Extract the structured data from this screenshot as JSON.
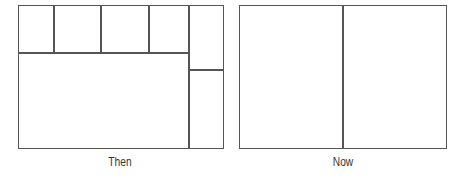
{
  "diagram": {
    "line_color": "#555555",
    "panels": [
      {
        "id": "then",
        "caption": "Then",
        "description": "Fragmented layout: four small boxes across the top, one large box below, and a right column split into two boxes",
        "regions": [
          "top-box-1",
          "top-box-2",
          "top-box-3",
          "top-box-4",
          "main-box",
          "right-top-box",
          "right-bottom-box"
        ]
      },
      {
        "id": "now",
        "caption": "Now",
        "description": "Simplified layout: two equal side-by-side boxes",
        "regions": [
          "left-box",
          "right-box"
        ]
      }
    ]
  }
}
